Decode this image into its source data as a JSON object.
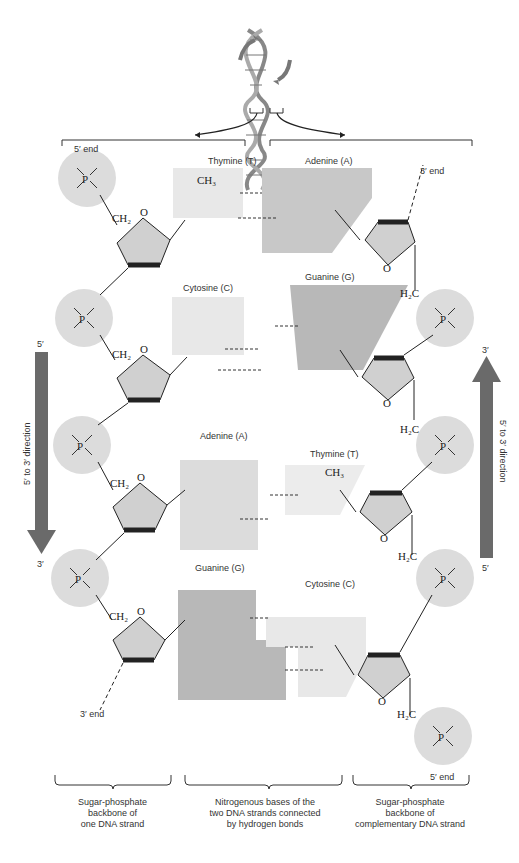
{
  "labels": {
    "five_end_top": "5′ end",
    "three_end_top": "3′ end",
    "three_end_bottom": "3′ end",
    "five_end_bottom": "5′ end",
    "left_arrow_top": "5′",
    "left_arrow_bottom": "3′",
    "left_arrow_text": "5′ to 3′ direction",
    "right_arrow_top": "3′",
    "right_arrow_bottom": "5′",
    "right_arrow_text": "5′ to 3′ direction"
  },
  "base_pairs": [
    {
      "left": "Thymine (T)",
      "right": "Adenine (A)",
      "h_bonds": 2
    },
    {
      "left": "Cytosine (C)",
      "right": "Guanine (G)",
      "h_bonds": 3
    },
    {
      "left": "Adenine (A)",
      "right": "Thymine (T)",
      "h_bonds": 2
    },
    {
      "left": "Guanine (G)",
      "right": "Cytosine (C)",
      "h_bonds": 3
    }
  ],
  "captions": {
    "left": [
      "Sugar-phosphate",
      "backbone of",
      "one DNA strand"
    ],
    "middle": [
      "Nitrogenous bases of the",
      "two DNA strands connected",
      "by hydrogen bonds"
    ],
    "right": [
      "Sugar-phosphate",
      "backbone of",
      "complementary DNA strand"
    ]
  },
  "chem": {
    "phosphate_P": "P",
    "O": "O",
    "O_minus": "O⁻",
    "minus_O": "⁻O",
    "CH2": "CH₂",
    "H2C": "H₂C",
    "CH3": "CH₃",
    "H": "H",
    "N": "N"
  },
  "colors": {
    "phosphate_fill": "#dcdcdc",
    "sugar_fill": "#d0d0d0",
    "purine_fill": "#c8c8c8",
    "pyrimidine_fill": "#e8e8e8",
    "guanine_fill": "#b8b8b8",
    "arrow": "#6a6a6a"
  }
}
